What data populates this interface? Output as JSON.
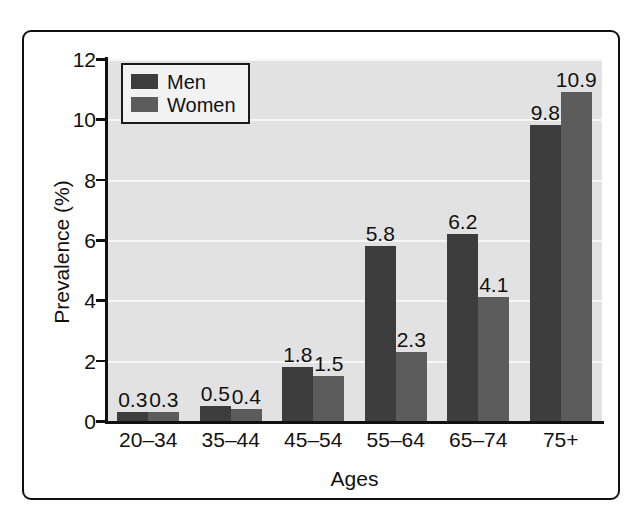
{
  "chart_data": {
    "type": "bar",
    "title": "",
    "subtitle": "",
    "xlabel": "Ages",
    "ylabel": "Prevalence (%)",
    "categories": [
      "20–34",
      "35–44",
      "45–54",
      "55–64",
      "65–74",
      "75+"
    ],
    "series": [
      {
        "name": "Men",
        "values": [
          0.3,
          0.5,
          1.8,
          5.8,
          6.2,
          9.8
        ],
        "color": "#3d3d3d"
      },
      {
        "name": "Women",
        "values": [
          0.3,
          0.4,
          1.5,
          2.3,
          4.1,
          10.9
        ],
        "color": "#5c5c5c"
      }
    ],
    "data_labels": [
      [
        "0.3",
        "0.3"
      ],
      [
        "0.5",
        "0.4"
      ],
      [
        "1.8",
        "1.5"
      ],
      [
        "5.8",
        "2.3"
      ],
      [
        "6.2",
        "4.1"
      ],
      [
        "9.8",
        "10.9"
      ]
    ],
    "ylim": [
      0,
      12
    ],
    "ytick_labels": [
      "0",
      "2",
      "4",
      "6",
      "8",
      "10",
      "12"
    ],
    "ytick_values": [
      0,
      2,
      4,
      6,
      8,
      10,
      12
    ],
    "grid": "horizontal",
    "gridline_color": "#f7f7f7",
    "plot_background": "#e2e2e2",
    "legend_position": "top-left",
    "legend_entries": [
      "Men",
      "Women"
    ]
  },
  "frame": {
    "border_color": "#111111"
  }
}
